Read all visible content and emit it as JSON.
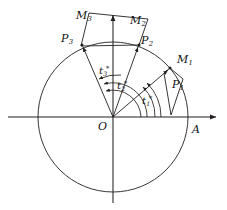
{
  "figure": {
    "background": "#ffffff",
    "stroke_color": "#231f20",
    "axis_color": "#231f20",
    "circle": {
      "cx": 113,
      "cy": 117,
      "r": 75
    },
    "axes": {
      "x": {
        "x1": 8,
        "y1": 117,
        "x2": 219,
        "y2": 117,
        "arrow": "right"
      },
      "y": {
        "x1": 113,
        "y1": 203,
        "x2": 113,
        "y2": 12,
        "arrow": "up"
      }
    },
    "points": [
      {
        "name": "P1",
        "x": 170,
        "y": 68
      },
      {
        "name": "P2",
        "x": 139,
        "y": 45
      },
      {
        "name": "P3",
        "x": 82,
        "y": 45
      },
      {
        "name": "A",
        "x": 188,
        "y": 117
      },
      {
        "name": "O",
        "x": 113,
        "y": 117
      }
    ],
    "wedges": [
      {
        "name": "M1",
        "path": "M 170 68 L 182 78 L 170 113 L 164 74 Z"
      },
      {
        "name": "M2M3",
        "path": "M 82 45 L 139 45 L 147 18 L 90 13 Z"
      }
    ],
    "rays": [
      {
        "from": "O",
        "to": "P1",
        "arrow": true
      },
      {
        "from": "O",
        "to": "P2",
        "arrow": true
      },
      {
        "from": "O",
        "to": "P3",
        "arrow": true
      }
    ],
    "arcs": [
      {
        "name": "t1-arc",
        "label": "t1"
      },
      {
        "name": "t2-arc",
        "label": "t2"
      },
      {
        "name": "t3-arc",
        "label": "t3"
      }
    ]
  },
  "labels": {
    "origin": {
      "text": "O",
      "sub": "",
      "star": "",
      "x": 98,
      "y": 121
    },
    "axis_a": {
      "text": "A",
      "sub": "",
      "star": "",
      "x": 192,
      "y": 124
    },
    "p1": {
      "text": "P",
      "sub": "1",
      "star": "",
      "x": 172,
      "y": 79
    },
    "p2": {
      "text": "P",
      "sub": "2",
      "star": "",
      "x": 141,
      "y": 35
    },
    "p3": {
      "text": "P",
      "sub": "3",
      "star": "",
      "x": 61,
      "y": 33
    },
    "m1": {
      "text": "M",
      "sub": "1",
      "star": "",
      "x": 177,
      "y": 54
    },
    "m2": {
      "text": "M",
      "sub": "2",
      "star": "",
      "x": 130,
      "y": 15
    },
    "m3": {
      "text": "M",
      "sub": "3",
      "star": "",
      "x": 76,
      "y": 10
    },
    "t3_inner": {
      "text": "t",
      "sub": "3",
      "star": "*",
      "x": 99,
      "y": 65
    },
    "t2_mid": {
      "text": "t",
      "sub": "2",
      "star": "*",
      "x": 117,
      "y": 80
    },
    "t1_outer": {
      "text": "t",
      "sub": "1",
      "star": "*",
      "x": 142,
      "y": 95
    }
  }
}
